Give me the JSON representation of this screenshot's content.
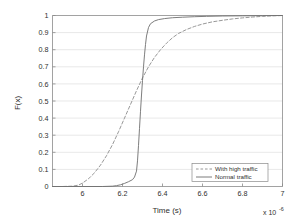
{
  "chart_data": {
    "type": "line",
    "title": "",
    "subtitle": "",
    "xlabel": "Time (s)",
    "ylabel": "F(x)",
    "x_exponent_label": "x 10",
    "x_exponent_power": "-6",
    "xlim": [
      5.85,
      7.0
    ],
    "ylim": [
      0,
      1
    ],
    "xticks": [
      "6",
      "6.2",
      "6.4",
      "6.6",
      "6.8",
      "7"
    ],
    "xtick_values": [
      6.0,
      6.2,
      6.4,
      6.6,
      6.8,
      7.0
    ],
    "yticks": [
      "0",
      "0.1",
      "0.2",
      "0.3",
      "0.4",
      "0.5",
      "0.6",
      "0.7",
      "0.8",
      "0.9",
      "1"
    ],
    "ytick_values": [
      0,
      0.1,
      0.2,
      0.3,
      0.4,
      0.5,
      0.6,
      0.7,
      0.8,
      0.9,
      1
    ],
    "grid": "horizontal",
    "legend_position": "lower right",
    "series": [
      {
        "name": "With high traffic",
        "style": "dashed",
        "color": "#8c8c8c",
        "x": [
          5.85,
          5.9,
          5.95,
          5.98,
          6.0,
          6.03,
          6.06,
          6.09,
          6.12,
          6.15,
          6.18,
          6.21,
          6.24,
          6.27,
          6.3,
          6.33,
          6.36,
          6.39,
          6.42,
          6.45,
          6.48,
          6.52,
          6.56,
          6.6,
          6.65,
          6.7,
          6.75,
          6.8,
          6.85,
          6.9,
          6.95,
          7.0
        ],
        "y": [
          0.0,
          0.0,
          0.002,
          0.008,
          0.02,
          0.045,
          0.08,
          0.125,
          0.18,
          0.245,
          0.32,
          0.4,
          0.48,
          0.56,
          0.635,
          0.7,
          0.755,
          0.8,
          0.838,
          0.87,
          0.895,
          0.918,
          0.936,
          0.95,
          0.963,
          0.972,
          0.98,
          0.986,
          0.991,
          0.995,
          0.998,
          1.0
        ]
      },
      {
        "name": "Normal traffic",
        "style": "solid",
        "color": "#6e6e6e",
        "x": [
          5.85,
          6.0,
          6.1,
          6.15,
          6.17,
          6.19,
          6.21,
          6.23,
          6.25,
          6.26,
          6.27,
          6.275,
          6.28,
          6.285,
          6.29,
          6.295,
          6.3,
          6.305,
          6.31,
          6.315,
          6.32,
          6.33,
          6.34,
          6.36,
          6.38,
          6.41,
          6.45,
          6.5,
          6.56,
          6.62,
          6.7,
          6.8,
          6.9,
          7.0
        ],
        "y": [
          0.0,
          0.0,
          0.0,
          0.002,
          0.005,
          0.01,
          0.018,
          0.028,
          0.04,
          0.055,
          0.09,
          0.15,
          0.24,
          0.34,
          0.44,
          0.535,
          0.62,
          0.7,
          0.77,
          0.83,
          0.88,
          0.93,
          0.952,
          0.968,
          0.976,
          0.982,
          0.987,
          0.99,
          0.993,
          0.995,
          0.997,
          0.998,
          0.999,
          1.0
        ]
      }
    ]
  },
  "legend": {
    "items": [
      {
        "label": "With high traffic"
      },
      {
        "label": "Normal traffic"
      }
    ]
  }
}
